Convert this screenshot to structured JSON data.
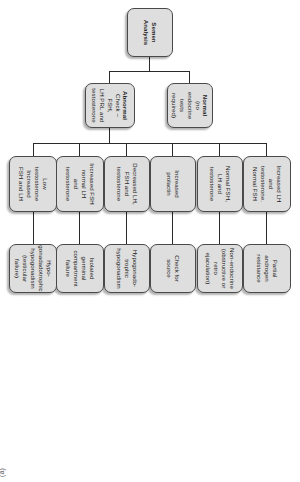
{
  "figure": {
    "panel_label": "(a)",
    "colors": {
      "node_fill": "#dedede",
      "node_border": "#4a4a4a",
      "connector": "#2a2a2a",
      "text": "#1a1a1a",
      "background": "#ffffff"
    }
  },
  "nodes": {
    "root": {
      "head": "Semen",
      "sub": "Analysis"
    },
    "level2": [
      {
        "head": "Normal",
        "sub": "(no endocrine\ntests\nrequired)"
      },
      {
        "head": "Abnormal",
        "sub": "Check – FSH,\nLH PRL and\ntestosterone"
      }
    ],
    "level3": [
      {
        "label": "Increased LH\nand\ntestosterone.\nNormal FSH"
      },
      {
        "label": "Normal FSH,\nLH and\ntestosterone"
      },
      {
        "label": "Increased\nprolactin"
      },
      {
        "label": "Decreased LH,\nFSH and\ntestosterone"
      },
      {
        "label": "Increased FSH\nnormal  LH\nand\ntestosterone"
      },
      {
        "label": "Low\ntestosterone\nIncreased\nFSH and LH"
      }
    ],
    "level4": [
      {
        "label": "Partial\nandrogen\nresistance"
      },
      {
        "label": "Non-endocrine\n(obstructive or\nretro\nejaculation)"
      },
      {
        "label": "Check for\nsource"
      },
      {
        "label": "Hypogonado-\ntrophic\nhypogonadism"
      },
      {
        "label": "Isolated\ngerminal\ncompartment\nfailure"
      },
      {
        "label": "Hypo-\ngonadadotrophic\nhypogonadism\n(testicular failure)"
      }
    ]
  }
}
